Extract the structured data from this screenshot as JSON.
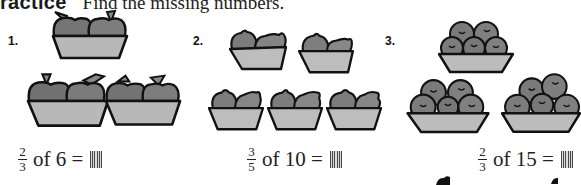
{
  "header": {
    "badge": "ractice",
    "instruction": "Find the missing numbers."
  },
  "problems": [
    {
      "number": "1.",
      "fruit": "apple",
      "baskets": 3,
      "fruits_per_basket": 2,
      "fraction": {
        "numerator": "2",
        "denominator": "3"
      },
      "text": "of 6 =",
      "answer": ""
    },
    {
      "number": "2.",
      "fruit": "lemon",
      "baskets": 5,
      "fruits_per_basket": 2,
      "fraction": {
        "numerator": "3",
        "denominator": "5"
      },
      "text": "of 10 =",
      "answer": ""
    },
    {
      "number": "3.",
      "fruit": "plum",
      "baskets": 3,
      "fruits_per_basket": 5,
      "fraction": {
        "numerator": "2",
        "denominator": "3"
      },
      "text": "of 15 =",
      "answer": ""
    }
  ],
  "colors": {
    "fruit": "#7a7a7a",
    "basket": "#b9b9b9",
    "outline": "#111111"
  }
}
